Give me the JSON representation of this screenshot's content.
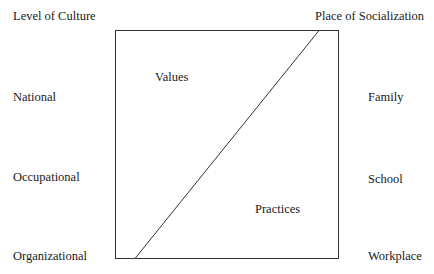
{
  "left_column": {
    "header": "Level of Culture",
    "items": [
      "National",
      "Occupational",
      "Organizational"
    ]
  },
  "right_column": {
    "header": "Place of Socialization",
    "items": [
      "Family",
      "School",
      "Workplace"
    ]
  },
  "box": {
    "upper_label": "Values",
    "lower_label": "Practices",
    "stroke_color": "#333333"
  }
}
